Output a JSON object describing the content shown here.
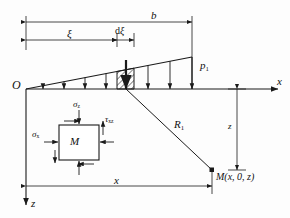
{
  "figure": {
    "type": "engineering-diagram"
  },
  "axes": {
    "origin_label": "O",
    "x_axis_label": "x",
    "z_axis_label": "z"
  },
  "dimensions": {
    "width_label": "b",
    "xi_label": "ξ",
    "dxi_label_d": "d",
    "dxi_label_xi": "ξ",
    "x_label": "x",
    "z_depth_label": "z"
  },
  "load": {
    "intensity_label": "p",
    "intensity_sub": "1",
    "arrow_count": 8
  },
  "point": {
    "radius_label": "R",
    "radius_sub": "1",
    "point_label": "M(x, 0, z)"
  },
  "element": {
    "center_label": "M",
    "sigma_z_label": "σ",
    "sigma_z_sub": "z",
    "sigma_x_label": "σ",
    "sigma_x_sub": "x",
    "tau_label": "τ",
    "tau_sub": "xz"
  },
  "colors": {
    "line": "#1a1a1a",
    "background": "#fdfdfd"
  }
}
